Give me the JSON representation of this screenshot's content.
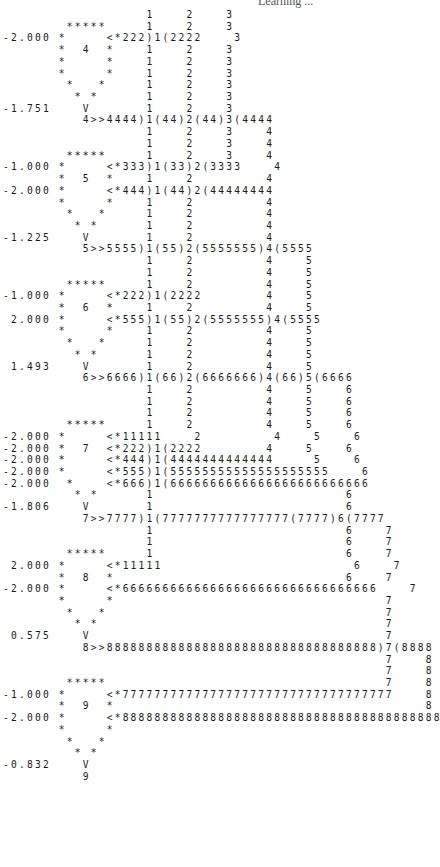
{
  "header": {
    "running_title": "Learning ..."
  },
  "printout": {
    "description": "Line-printer trace of a recurrent network of units 4-9 with connection weights and activation values",
    "units": [
      {
        "unit": 4,
        "weights": [
          "-2.000"
        ],
        "activation": "-1.751"
      },
      {
        "unit": 5,
        "weights": [
          "-1.000",
          "-2.000"
        ],
        "activation": "-1.225"
      },
      {
        "unit": 6,
        "weights": [
          "-1.000",
          "2.000"
        ],
        "activation": "1.493"
      },
      {
        "unit": 7,
        "weights": [
          "-2.000",
          "-2.000",
          "-2.000",
          "-2.000",
          "-2.000"
        ],
        "activation": "-1.806"
      },
      {
        "unit": 8,
        "weights": [
          "2.000",
          "-2.000"
        ],
        "activation": "0.575"
      },
      {
        "unit": 9,
        "weights": [
          "-1.000",
          "-2.000"
        ],
        "activation": "-0.832"
      }
    ],
    "lines": [
      "                  1    2    3",
      "        *****     1    2    3",
      "-2.000 *     <*222)1(2222    3",
      "       *  4  *    1    2    3",
      "       *     *    1    2    3",
      "       *     *    1    2    3",
      "        *   *     1    2    3",
      "         * *      1    2    3",
      "-1.751    V       1    2    3",
      "          4>>4444)1(44)2(44)3(4444",
      "                  1    2    3    4",
      "                  1    2    3    4",
      "        *****     1    2    3    4",
      "-1.000 *     <*333)1(33)2(3333    4",
      "       *  5  *    1    2         4",
      "-2.000 *     <*444)1(44)2(44444444",
      "       *     *    1    2         4",
      "        *   *     1    2         4",
      "         * *      1    2         4",
      "-1.225    V       1    2         4",
      "          5>>5555)1(55)2(5555555)4(5555",
      "                  1    2         4    5",
      "                  1    2         4    5",
      "        *****     1    2         4    5",
      "-1.000 *     <*222)1(2222        4    5",
      "       *  6  *    1    2         4    5",
      " 2.000 *     <*555)1(55)2(5555555)4(5555",
      "       *     *    1    2         4    5",
      "        *   *     1    2         4    5",
      "         * *      1    2         4    5",
      " 1.493    V       1    2         4    5",
      "          6>>6666)1(66)2(6666666)4(66)5(6666",
      "                  1    2         4    5    6",
      "                  1    2         4    5    6",
      "                  1    2         4    5    6",
      "        *****     1    2         4    5    6",
      "-2.000 *     <*11111    2         4    5    6",
      "-2.000 *  7  <*222)1(2222        4    5    6",
      "-2.000 *     <*444)1(4444444444444     5    6",
      "-2.000 *     <*555)1(55555555555555555555    6",
      "-2.000  *    <*666)1(6666666666666666666666666",
      "         * *      1                        6",
      "-1.806    V       1                        6",
      "          7>>7777)1(7777777777777777(7777)6(7777",
      "                  1                        6    7",
      "                  1                        6    7",
      "        *****     1                        6    7",
      " 2.000 *     <*11111                        6    7",
      "       *  8  *                             6    7",
      "-2.000 *     <*66666666666666666666666666666666    7",
      "       *     *                                  7",
      "        *   *                                   7",
      "         * *                                    7",
      " 0.575    V                                     7",
      "          8>>8888888888888888888888888888888888)7(8888",
      "                                                7    8",
      "                                                7    8",
      "        *****                                   7    8",
      "-1.000 *     <*7777777777777777777777777777777777    8",
      "       *  9  *                                       8",
      "-2.000 *     <*88888888888888888888888888888888888888888",
      "       *     *",
      "        *   *",
      "         * *",
      "-0.832    V",
      "          9"
    ]
  }
}
